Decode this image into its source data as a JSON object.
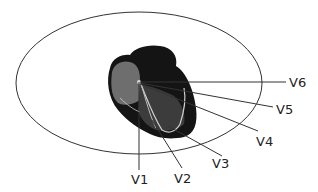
{
  "diagram": {
    "leads": [
      {
        "id": "V1",
        "label": "V1"
      },
      {
        "id": "V2",
        "label": "V2"
      },
      {
        "id": "V3",
        "label": "V3"
      },
      {
        "id": "V4",
        "label": "V4"
      },
      {
        "id": "V5",
        "label": "V5"
      },
      {
        "id": "V6",
        "label": "V6"
      }
    ]
  }
}
